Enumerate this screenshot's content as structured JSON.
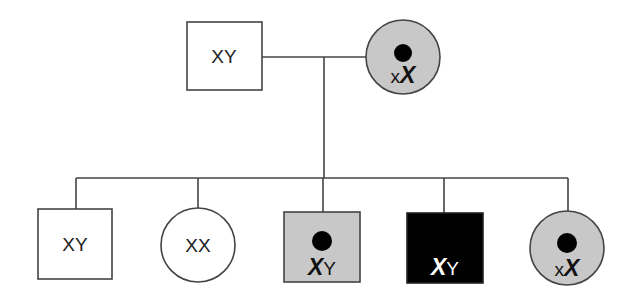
{
  "diagram": {
    "type": "pedigree",
    "colors": {
      "line": "#444444",
      "carrier_fill": "#c8c8c8",
      "affected_fill": "#000000",
      "unaffected_fill": "#ffffff",
      "dot": "#000000"
    },
    "parents": {
      "father": {
        "label": "XY",
        "sex": "male",
        "status": "unaffected"
      },
      "mother": {
        "label_small": "x",
        "label_big": "X",
        "sex": "female",
        "status": "carrier"
      }
    },
    "children": [
      {
        "label": "XY",
        "sex": "male",
        "status": "unaffected"
      },
      {
        "label": "XX",
        "sex": "female",
        "status": "unaffected"
      },
      {
        "label_big": "X",
        "label_small": "Y",
        "sex": "male",
        "status": "carrier-marked"
      },
      {
        "label_big": "X",
        "label_small": "Y",
        "sex": "male",
        "status": "affected"
      },
      {
        "label_small": "x",
        "label_big": "X",
        "sex": "female",
        "status": "carrier"
      }
    ]
  }
}
